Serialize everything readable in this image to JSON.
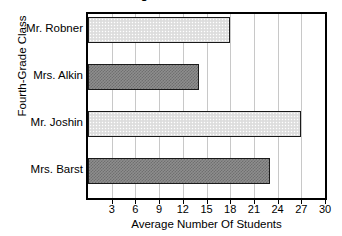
{
  "chart_data": {
    "type": "bar",
    "orientation": "horizontal",
    "title": "Number of Young Athletes Across The Year",
    "xlabel": "Average Number Of Students",
    "ylabel": "Fourth-Grade Class",
    "categories": [
      "Mr. Robner",
      "Mrs. Alkin",
      "Mr. Joshin",
      "Mrs. Barst"
    ],
    "values": [
      18,
      14,
      27,
      23
    ],
    "xlim": [
      0,
      30
    ],
    "xticks": [
      3,
      6,
      9,
      12,
      15,
      18,
      21,
      24,
      27,
      30
    ],
    "grid": true,
    "legend": "none",
    "bar_fills": [
      "light-dotted",
      "dark-checkered",
      "light-dotted",
      "dark-checkered"
    ]
  },
  "colors": {
    "axis": "#000000",
    "grid": "#c8c8c8",
    "bar_light": "#e2e2e2",
    "bar_dark": "#8e8e8e",
    "bar_border": "#1a1a1a",
    "background": "#ffffff"
  }
}
